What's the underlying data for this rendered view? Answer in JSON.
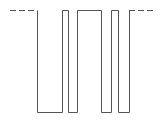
{
  "diagram": {
    "type": "digital-waveform",
    "stroke_color": "#555555",
    "background": "#ffffff",
    "high_y": 10.5,
    "low_y": 112.5,
    "lead_in_dash": {
      "x1": 10,
      "x2": 37
    },
    "lead_out_dash": {
      "x1": 129,
      "x2": 156
    },
    "dash_pattern": "6,3",
    "edges_x": [
      37,
      62,
      68,
      77,
      101,
      111,
      118,
      129
    ],
    "levels": [
      "high",
      "low",
      "high",
      "low",
      "high",
      "low",
      "high",
      "low",
      "high"
    ]
  }
}
